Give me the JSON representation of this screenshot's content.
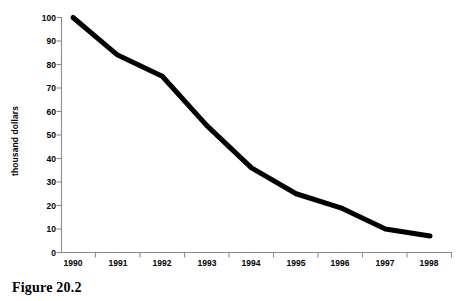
{
  "figure": {
    "caption": "Figure 20.2"
  },
  "axes": {
    "y_axis_title": "thousand dollars",
    "y_tick_labels": [
      "100",
      "90",
      "80",
      "70",
      "60",
      "50",
      "40",
      "30",
      "20",
      "10",
      "0"
    ],
    "x_tick_labels": [
      "1990",
      "1991",
      "1992",
      "1993",
      "1994",
      "1995",
      "1996",
      "1997",
      "1998"
    ]
  },
  "style": {
    "line_color": "#000000",
    "axis_color": "#8c8c8c",
    "background": "#ffffff",
    "line_width": 5
  },
  "chart_data": {
    "type": "line",
    "title": "",
    "subtitle": "",
    "xlabel": "",
    "ylabel": "thousand dollars",
    "categories": [
      "1990",
      "1991",
      "1992",
      "1993",
      "1994",
      "1995",
      "1996",
      "1997",
      "1998"
    ],
    "x": [
      1990,
      1991,
      1992,
      1993,
      1994,
      1995,
      1996,
      1997,
      1998
    ],
    "values": [
      100,
      84,
      75,
      54,
      36,
      25,
      19,
      10,
      7
    ],
    "series": [
      {
        "name": "thousand dollars",
        "values": [
          100,
          84,
          75,
          54,
          36,
          25,
          19,
          10,
          7
        ]
      }
    ],
    "ylim": [
      0,
      100
    ],
    "ytick_values": [
      0,
      10,
      20,
      30,
      40,
      50,
      60,
      70,
      80,
      90,
      100
    ],
    "xlim": [
      1990,
      1998
    ],
    "grid": false,
    "legend": false,
    "legend_position": "none",
    "markers": false,
    "annotations": []
  }
}
